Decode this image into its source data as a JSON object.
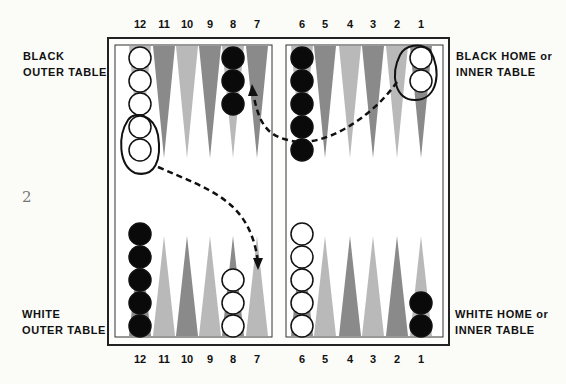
{
  "labels": {
    "black_outer": [
      "BLACK",
      "OUTER TABLE"
    ],
    "black_home": [
      "BLACK HOME or",
      "INNER TABLE"
    ],
    "white_outer": [
      "WHITE",
      "OUTER TABLE"
    ],
    "white_home": [
      "WHITE HOME or",
      "INNER TABLE"
    ]
  },
  "page_number": "2",
  "top_points": [
    "12",
    "11",
    "10",
    "9",
    "8",
    "7",
    "6",
    "5",
    "4",
    "3",
    "2",
    "1"
  ],
  "bottom_points": [
    "12",
    "11",
    "10",
    "9",
    "8",
    "7",
    "6",
    "5",
    "4",
    "3",
    "2",
    "1"
  ],
  "colors": {
    "dark_point": "#8a8a8a",
    "light_point": "#b9b9b9",
    "black_checker": "#0a0a0a",
    "white_checker": "#ffffff",
    "frame": "#222222"
  },
  "checkers": {
    "top": [
      {
        "point": "12",
        "color": "white",
        "count": 5
      },
      {
        "point": "8",
        "color": "black",
        "count": 3
      },
      {
        "point": "6",
        "color": "black",
        "count": 5
      },
      {
        "point": "1",
        "color": "white",
        "count": 2
      }
    ],
    "bottom": [
      {
        "point": "12",
        "color": "black",
        "count": 5
      },
      {
        "point": "8",
        "color": "white",
        "count": 3
      },
      {
        "point": "6",
        "color": "white",
        "count": 5
      },
      {
        "point": "1",
        "color": "black",
        "count": 2
      }
    ]
  }
}
